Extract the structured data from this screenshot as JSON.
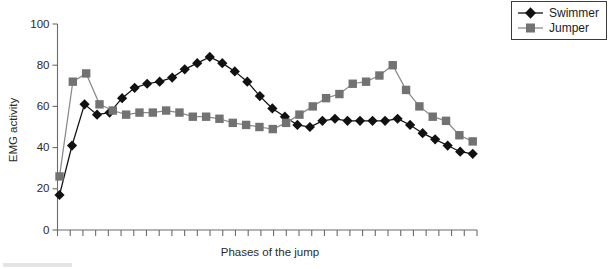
{
  "chart_data": {
    "type": "line",
    "title": "",
    "subtitle": "",
    "xlabel": "Phases of the jump",
    "ylabel": "EMG  activity",
    "ylim": [
      0,
      100
    ],
    "ytick_labels": [
      "0",
      "20",
      "40",
      "60",
      "80",
      "100"
    ],
    "yticks": [
      0,
      20,
      40,
      60,
      80,
      100
    ],
    "grid": false,
    "xtick_labels": [],
    "x_tick_count": 34,
    "legend_position": "top-right-outside",
    "legend": [
      "Swimmer",
      "Jumper"
    ],
    "series": [
      {
        "name": "Swimmer",
        "color": "#111111",
        "marker": "diamond",
        "values": [
          17,
          41,
          61,
          56,
          57,
          64,
          69,
          71,
          72,
          74,
          78,
          81,
          84,
          81,
          77,
          72,
          65,
          59,
          55,
          51,
          50,
          53,
          54,
          53,
          53,
          53,
          53,
          54,
          51,
          47,
          44,
          41,
          38,
          37
        ]
      },
      {
        "name": "Jumper",
        "color": "#727272",
        "marker": "square",
        "values": [
          26,
          72,
          76,
          61,
          58,
          56,
          57,
          57,
          58,
          57,
          55,
          55,
          54,
          52,
          51,
          50,
          49,
          52,
          56,
          60,
          64,
          66,
          71,
          72,
          75,
          80,
          68,
          60,
          55,
          53,
          46,
          43
        ]
      }
    ]
  },
  "axes": {
    "y_label_text": "EMG  activity",
    "x_label_text": "Phases of the jump"
  },
  "legend": {
    "items": [
      {
        "label": "Swimmer",
        "marker": "diamond-marker",
        "color": "#111111"
      },
      {
        "label": "Jumper",
        "marker": "square-marker",
        "color": "#727272"
      }
    ]
  },
  "colors": {
    "swimmer": "#111111",
    "jumper": "#727272",
    "axis": "#6b6b6b",
    "text": "#2a2a2a",
    "background": "#ffffff"
  }
}
